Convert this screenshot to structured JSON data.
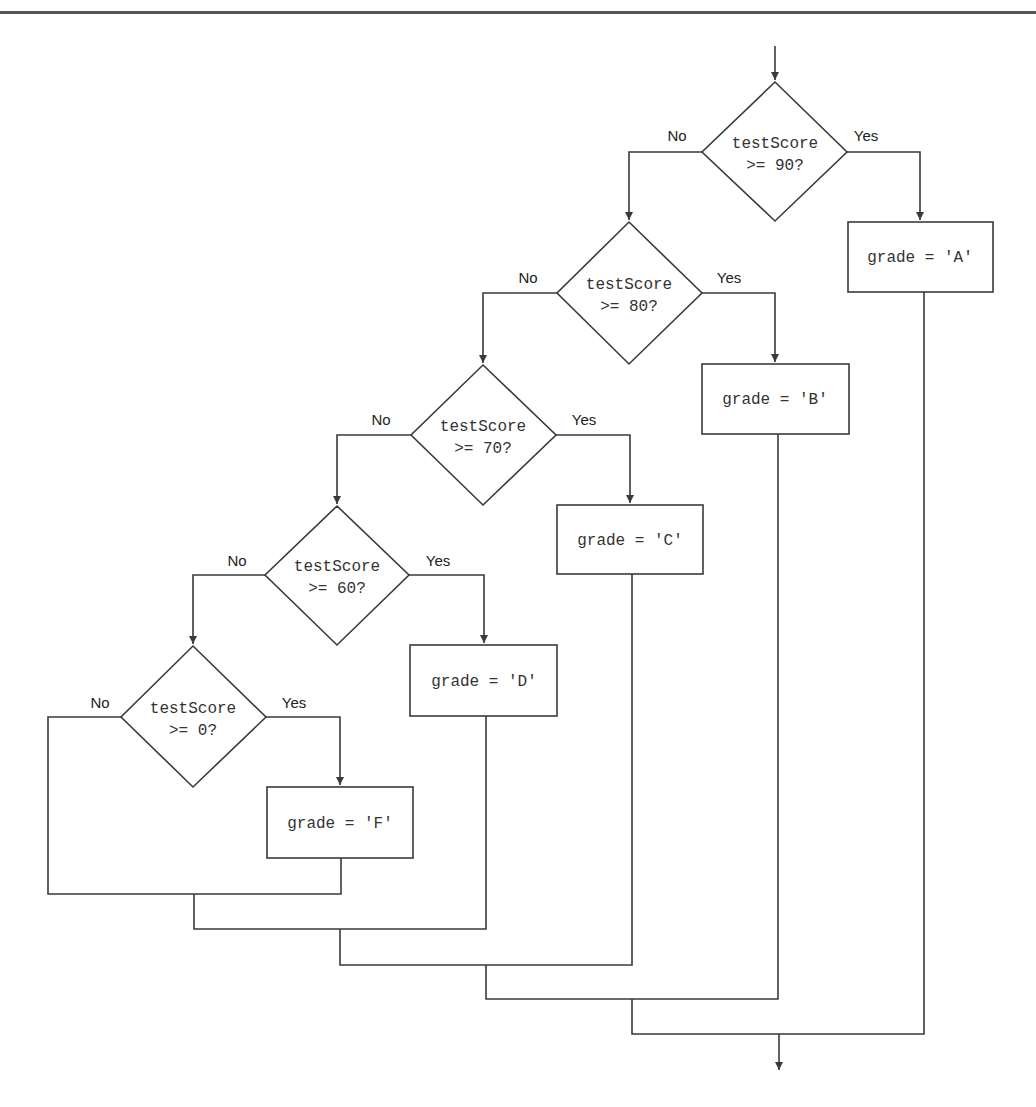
{
  "diagram": {
    "type": "flowchart",
    "branch_labels": {
      "no": "No",
      "yes": "Yes"
    },
    "decisions": [
      {
        "line1": "testScore",
        "line2": ">= 90?"
      },
      {
        "line1": "testScore",
        "line2": ">= 80?"
      },
      {
        "line1": "testScore",
        "line2": ">= 70?"
      },
      {
        "line1": "testScore",
        "line2": ">= 60?"
      },
      {
        "line1": "testScore",
        "line2": ">= 0?"
      }
    ],
    "processes": [
      {
        "label": "grade = 'A'"
      },
      {
        "label": "grade = 'B'"
      },
      {
        "label": "grade = 'C'"
      },
      {
        "label": "grade = 'D'"
      },
      {
        "label": "grade = 'F'"
      }
    ],
    "colors": {
      "stroke": "#3a3a3a",
      "text": "#333333",
      "background": "#ffffff"
    }
  }
}
